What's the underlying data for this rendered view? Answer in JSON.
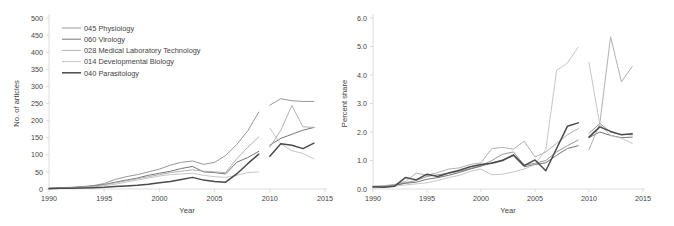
{
  "figure": {
    "panels": [
      "left",
      "right"
    ],
    "background": "#ffffff"
  },
  "legend": {
    "position": "upper-left-of-left-panel",
    "entries": [
      {
        "code": "045",
        "name": "Physiology",
        "label": "045 Physiology",
        "color": "#8c8c8c"
      },
      {
        "code": "060",
        "name": "Virology",
        "label": "060 Virology",
        "color": "#676767"
      },
      {
        "code": "028",
        "name": "Medical Laboratory Technology",
        "label": "028 Medical Laboratory Technology",
        "color": "#a8a8a8"
      },
      {
        "code": "014",
        "name": "Developmental Biology",
        "label": "014 Developmental Biology",
        "color": "#bfbfbf"
      },
      {
        "code": "040",
        "name": "Parasitology",
        "label": "040 Parasitology",
        "color": "#4a4a4a"
      }
    ]
  },
  "chart_data": [
    {
      "id": "articles",
      "type": "line",
      "title": "",
      "xlabel": "Year",
      "ylabel": "No. of articles",
      "xlim": [
        1990,
        2015
      ],
      "ylim": [
        0,
        500
      ],
      "xticks": [
        1990,
        1995,
        2000,
        2005,
        2010,
        2015
      ],
      "xtick_labels": [
        "1990",
        "1995",
        "2000",
        "2005",
        "2010",
        "2015"
      ],
      "yticks": [
        0,
        50,
        100,
        150,
        200,
        250,
        300,
        350,
        400,
        450,
        500
      ],
      "ytick_labels": [
        "0",
        "50",
        "100",
        "150",
        "200",
        "250",
        "300",
        "350",
        "400",
        "450",
        "500"
      ],
      "grid": false,
      "legend_position": "upper left",
      "note": "Each series is drawn as two disjoint segments: 1990-2009 and 2010-2014",
      "series": [
        {
          "name": "045 Physiology",
          "color": "#8c8c8c",
          "width": 0.9,
          "segments": [
            {
              "x": [
                1990,
                1991,
                1992,
                1993,
                1994,
                1995,
                1996,
                1997,
                1998,
                1999,
                2000,
                2001,
                2002,
                2003,
                2004,
                2005,
                2006,
                2007,
                2008,
                2009
              ],
              "y": [
                3,
                4,
                5,
                7,
                10,
                16,
                28,
                36,
                42,
                50,
                58,
                70,
                78,
                82,
                72,
                78,
                98,
                130,
                170,
                225
              ]
            },
            {
              "x": [
                2010,
                2011,
                2012,
                2013,
                2014
              ],
              "y": [
                245,
                264,
                258,
                256,
                256
              ]
            }
          ]
        },
        {
          "name": "060 Virology",
          "color": "#676767",
          "width": 0.9,
          "segments": [
            {
              "x": [
                1990,
                1991,
                1992,
                1993,
                1994,
                1995,
                1996,
                1997,
                1998,
                1999,
                2000,
                2001,
                2002,
                2003,
                2004,
                2005,
                2006,
                2007,
                2008,
                2009
              ],
              "y": [
                2,
                3,
                4,
                6,
                9,
                13,
                20,
                26,
                32,
                40,
                46,
                52,
                60,
                66,
                50,
                48,
                44,
                78,
                92,
                110
              ]
            },
            {
              "x": [
                2010,
                2011,
                2012,
                2013,
                2014
              ],
              "y": [
                128,
                148,
                160,
                172,
                180
              ]
            }
          ]
        },
        {
          "name": "028 Medical Laboratory Technology",
          "color": "#a8a8a8",
          "width": 0.9,
          "segments": [
            {
              "x": [
                1990,
                1991,
                1992,
                1993,
                1994,
                1995,
                1996,
                1997,
                1998,
                1999,
                2000,
                2001,
                2002,
                2003,
                2004,
                2005,
                2006,
                2007,
                2008,
                2009
              ],
              "y": [
                2,
                3,
                4,
                6,
                8,
                12,
                18,
                24,
                30,
                36,
                42,
                48,
                52,
                56,
                52,
                50,
                48,
                88,
                122,
                152
              ]
            },
            {
              "x": [
                2010,
                2011,
                2012,
                2013,
                2014
              ],
              "y": [
                122,
                172,
                244,
                182,
                180
              ]
            }
          ]
        },
        {
          "name": "014 Developmental Biology",
          "color": "#bfbfbf",
          "width": 0.9,
          "segments": [
            {
              "x": [
                1990,
                1991,
                1992,
                1993,
                1994,
                1995,
                1996,
                1997,
                1998,
                1999,
                2000,
                2001,
                2002,
                2003,
                2004,
                2005,
                2006,
                2007,
                2008,
                2009
              ],
              "y": [
                2,
                2,
                3,
                4,
                6,
                10,
                14,
                20,
                26,
                32,
                38,
                42,
                44,
                46,
                40,
                36,
                34,
                40,
                48,
                50
              ]
            },
            {
              "x": [
                2010,
                2011,
                2012,
                2013,
                2014
              ],
              "y": [
                178,
                132,
                112,
                104,
                88
              ]
            }
          ]
        },
        {
          "name": "040 Parasitology",
          "color": "#4a4a4a",
          "width": 1.5,
          "segments": [
            {
              "x": [
                1990,
                1991,
                1992,
                1993,
                1994,
                1995,
                1996,
                1997,
                1998,
                1999,
                2000,
                2001,
                2002,
                2003,
                2004,
                2005,
                2006,
                2007,
                2008,
                2009
              ],
              "y": [
                1,
                2,
                2,
                3,
                4,
                5,
                7,
                9,
                11,
                14,
                18,
                22,
                28,
                34,
                26,
                22,
                20,
                44,
                74,
                102
              ]
            },
            {
              "x": [
                2010,
                2011,
                2012,
                2013,
                2014
              ],
              "y": [
                96,
                132,
                128,
                118,
                134
              ]
            }
          ]
        }
      ]
    },
    {
      "id": "percent-share",
      "type": "line",
      "title": "",
      "xlabel": "Year",
      "ylabel": "Percent share",
      "xlim": [
        1990,
        2015
      ],
      "ylim": [
        0.0,
        6.0
      ],
      "xticks": [
        1990,
        1995,
        2000,
        2005,
        2010,
        2015
      ],
      "xtick_labels": [
        "1990",
        "1995",
        "2000",
        "2005",
        "2010",
        "2015"
      ],
      "yticks": [
        0.0,
        1.0,
        2.0,
        3.0,
        4.0,
        5.0,
        6.0
      ],
      "ytick_labels": [
        "0.0",
        "1.0",
        "2.0",
        "3.0",
        "4.0",
        "5.0",
        "6.0"
      ],
      "grid": false,
      "legend_position": "none",
      "note": "Each series is drawn as two disjoint segments: 1990-2009 and 2010-2014",
      "series": [
        {
          "name": "045 Physiology",
          "color": "#8c8c8c",
          "width": 0.9,
          "segments": [
            {
              "x": [
                1990,
                1991,
                1992,
                1993,
                1994,
                1995,
                1996,
                1997,
                1998,
                1999,
                2000,
                2001,
                2002,
                2003,
                2004,
                2005,
                2006,
                2007,
                2008,
                2009
              ],
              "y": [
                0.08,
                0.1,
                0.14,
                0.22,
                0.3,
                0.44,
                0.5,
                0.55,
                0.62,
                0.72,
                0.82,
                1.0,
                1.22,
                1.3,
                0.84,
                0.9,
                1.0,
                1.3,
                1.52,
                1.72
              ]
            },
            {
              "x": [
                2010,
                2011,
                2012,
                2013,
                2014
              ],
              "y": [
                1.95,
                2.3,
                2.0,
                1.92,
                1.9
              ]
            }
          ]
        },
        {
          "name": "060 Virology",
          "color": "#676767",
          "width": 0.9,
          "segments": [
            {
              "x": [
                1990,
                1991,
                1992,
                1993,
                1994,
                1995,
                1996,
                1997,
                1998,
                1999,
                2000,
                2001,
                2002,
                2003,
                2004,
                2005,
                2006,
                2007,
                2008,
                2009
              ],
              "y": [
                0.06,
                0.08,
                0.12,
                0.2,
                0.24,
                0.34,
                0.4,
                0.48,
                0.58,
                0.7,
                0.8,
                0.92,
                1.02,
                1.16,
                0.78,
                0.86,
                0.92,
                1.18,
                1.42,
                1.52
              ]
            },
            {
              "x": [
                2010,
                2011,
                2012,
                2013,
                2014
              ],
              "y": [
                1.8,
                2.0,
                1.88,
                1.8,
                1.82
              ]
            }
          ]
        },
        {
          "name": "028 Medical Laboratory Technology",
          "color": "#a8a8a8",
          "width": 0.9,
          "segments": [
            {
              "x": [
                1990,
                1991,
                1992,
                1993,
                1994,
                1995,
                1996,
                1997,
                1998,
                1999,
                2000,
                2001,
                2002,
                2003,
                2004,
                2005,
                2006,
                2007,
                2008,
                2009
              ],
              "y": [
                0.1,
                0.12,
                0.16,
                0.26,
                0.56,
                0.48,
                0.58,
                0.7,
                0.74,
                0.86,
                0.92,
                1.42,
                1.46,
                1.4,
                1.68,
                1.12,
                1.3,
                1.6,
                1.9,
                2.12
              ]
            },
            {
              "x": [
                2010,
                2011,
                2012,
                2013,
                2014
              ],
              "y": [
                1.38,
                2.3,
                5.34,
                3.76,
                4.3
              ]
            }
          ]
        },
        {
          "name": "014 Developmental Biology",
          "color": "#bfbfbf",
          "width": 0.9,
          "segments": [
            {
              "x": [
                1990,
                1991,
                1992,
                1993,
                1994,
                1995,
                1996,
                1997,
                1998,
                1999,
                2000,
                2001,
                2002,
                2003,
                2004,
                2005,
                2006,
                2007,
                2008,
                2009
              ],
              "y": [
                0.04,
                0.06,
                0.1,
                0.14,
                0.18,
                0.22,
                0.3,
                0.4,
                0.48,
                0.62,
                0.7,
                0.5,
                0.52,
                0.6,
                0.7,
                0.86,
                1.38,
                4.16,
                4.42,
                4.98
              ]
            },
            {
              "x": [
                2010,
                2011,
                2012,
                2013,
                2014
              ],
              "y": [
                4.44,
                2.26,
                1.88,
                1.78,
                1.6
              ]
            }
          ]
        },
        {
          "name": "040 Parasitology",
          "color": "#4a4a4a",
          "width": 1.5,
          "segments": [
            {
              "x": [
                1990,
                1991,
                1992,
                1993,
                1994,
                1995,
                1996,
                1997,
                1998,
                1999,
                2000,
                2001,
                2002,
                2003,
                2004,
                2005,
                2006,
                2007,
                2008,
                2009
              ],
              "y": [
                0.08,
                0.06,
                0.1,
                0.4,
                0.32,
                0.52,
                0.44,
                0.56,
                0.66,
                0.78,
                0.86,
                0.9,
                1.0,
                1.2,
                0.82,
                1.02,
                0.64,
                1.42,
                2.2,
                2.32
              ]
            },
            {
              "x": [
                2010,
                2011,
                2012,
                2013,
                2014
              ],
              "y": [
                1.82,
                2.18,
                2.02,
                1.9,
                1.94
              ]
            }
          ]
        }
      ]
    }
  ]
}
